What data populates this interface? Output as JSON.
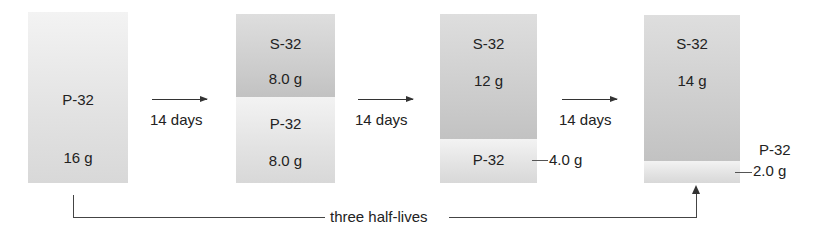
{
  "diagram": {
    "type": "radioactive-decay-sequence",
    "steps": [
      {
        "segments": [
          {
            "kind": "P",
            "isotope": "P-32",
            "mass": "16 g"
          }
        ]
      },
      {
        "segments": [
          {
            "kind": "S",
            "isotope": "S-32",
            "mass": "8.0 g"
          },
          {
            "kind": "P",
            "isotope": "P-32",
            "mass": "8.0 g"
          }
        ]
      },
      {
        "segments": [
          {
            "kind": "S",
            "isotope": "S-32",
            "mass": "12 g"
          },
          {
            "kind": "P",
            "isotope": "P-32",
            "mass": "4.0 g"
          }
        ]
      },
      {
        "segments": [
          {
            "kind": "S",
            "isotope": "S-32",
            "mass": "14 g"
          },
          {
            "kind": "P",
            "isotope": "P-32",
            "mass": "2.0 g"
          }
        ]
      }
    ],
    "transitions": [
      {
        "label": "14 days"
      },
      {
        "label": "14 days"
      },
      {
        "label": "14 days"
      }
    ],
    "bracket_label": "three half-lives",
    "colors": {
      "p32_fill": "#e2e2e2",
      "s32_fill": "#cbcbcb",
      "line": "#333333"
    }
  }
}
